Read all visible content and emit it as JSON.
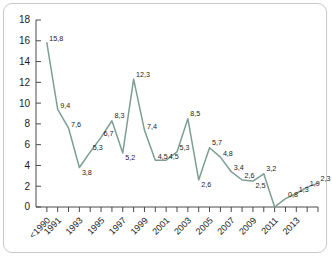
{
  "chart_data": {
    "type": "line",
    "title": "",
    "subtitle": "",
    "xlabel": "",
    "ylabel": "",
    "grid": false,
    "legend": false,
    "legend_position": "none",
    "decimal_separator": ",",
    "series_color": "#7d9f93",
    "categories": [
      "<1990",
      "1991",
      "1992",
      "1993",
      "1994",
      "1995",
      "1996",
      "1997",
      "1998",
      "1999",
      "2000",
      "2001",
      "2002",
      "2003",
      "2004",
      "2005",
      "2006",
      "2007",
      "2008",
      "2009",
      "2010",
      "2011",
      "2012",
      "2013",
      "2014"
    ],
    "tick_labels": [
      "<1990",
      "1991",
      "",
      "1993",
      "",
      "1995",
      "",
      "1997",
      "",
      "1999",
      "",
      "2001",
      "",
      "2003",
      "",
      "2005",
      "",
      "2007",
      "",
      "2009",
      "",
      "2011",
      "",
      "2013",
      ""
    ],
    "values": [
      15.8,
      9.4,
      7.6,
      3.8,
      5.3,
      6.7,
      8.3,
      5.2,
      12.3,
      7.4,
      4.5,
      4.5,
      5.3,
      8.5,
      2.6,
      5.7,
      4.8,
      3.4,
      2.6,
      2.5,
      3.2,
      0.0,
      0.8,
      1.3,
      1.9
    ],
    "point_labels": [
      "15,8",
      "9,4",
      "7,6",
      "3,8",
      "5,3",
      "6,7",
      "8,3",
      "5,2",
      "12,3",
      "7,4",
      "4,5",
      "4,5",
      "5,3",
      "8,5",
      "2,6",
      "5,7",
      "4,8",
      "3,4",
      "2,6",
      "2,5",
      "3,2",
      "",
      "0,8",
      "1,3",
      "1,9"
    ],
    "extra_point_label": "2,3",
    "ylim": [
      0,
      18
    ],
    "yticks": [
      0,
      2,
      4,
      6,
      8,
      10,
      12,
      14,
      16,
      18
    ],
    "ytick_labels": [
      "0",
      "2",
      "4",
      "6",
      "8",
      "10",
      "12",
      "14",
      "16",
      "18"
    ]
  }
}
